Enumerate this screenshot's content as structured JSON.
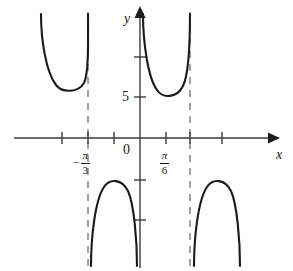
{
  "figure": {
    "background_color": "#ffffff",
    "curve_color": "#1a1a1a",
    "axis_color": "#3b3b3b",
    "asymptote_color": "#8c8c8c"
  },
  "axes": {
    "x_label": "x",
    "y_label": "y",
    "origin_label": "0"
  },
  "x_tick_labels": [
    {
      "id": "neg-pi-over-3",
      "sign": "−",
      "numerator": "π",
      "denominator": "3",
      "x_value": -1.0471975512
    },
    {
      "id": "pi-over-6",
      "sign": "",
      "numerator": "π",
      "denominator": "6",
      "x_value": 0.5235987756
    }
  ],
  "y_tick_labels": [
    {
      "id": "y-five",
      "text": "5",
      "y_value": 5
    }
  ],
  "chart_data": {
    "type": "line",
    "title": "",
    "xlabel": "x",
    "ylabel": "y",
    "grid": false,
    "legend": null,
    "function_form": "y = 5 sec(3x)",
    "xlim": [
      -1.85,
      1.85
    ],
    "ylim": [
      -11.5,
      13.5
    ],
    "x_axis": {
      "tick_pixel_positions": [
        62,
        88,
        114,
        166,
        190,
        222
      ],
      "labeled_ticks": [
        {
          "label": "-π/3",
          "pixel_x": 88
        },
        {
          "label": "π/6",
          "pixel_x": 166
        }
      ],
      "arrow": "right"
    },
    "y_axis": {
      "tick_values": [
        10,
        5,
        -5,
        -10
      ],
      "tick_pixel_positions": [
        57,
        97,
        180,
        220
      ],
      "labeled_ticks": [
        {
          "label": "5",
          "pixel_y": 97
        }
      ],
      "arrow": "up"
    },
    "asymptotes": [
      {
        "label": "x = -π/2",
        "pixel_x": 88,
        "style": "dashed"
      },
      {
        "label": "x = π/2",
        "pixel_x": 190,
        "style": "dashed"
      }
    ],
    "branches": [
      {
        "name": "upper-left-branch",
        "shape": "opens-upward",
        "minimum_point": {
          "pixel": [
            70,
            92
          ],
          "value": 5
        },
        "path": "M 41,14 C 41,40 46,72 56,85 C 62,93 78,93 84,83 C 89,73 88,40 88,14"
      },
      {
        "name": "upper-middle-branch",
        "shape": "opens-upward",
        "minimum_point": {
          "pixel": [
            165,
            97
          ],
          "value": 5
        },
        "path": "M 143,14 C 143,42 148,78 157,90 C 163,99 177,98 183,86 C 189,74 190,38 190,14"
      },
      {
        "name": "lower-left-branch",
        "shape": "opens-downward",
        "maximum_point": {
          "pixel": [
            113,
            180
          ],
          "value": -5
        },
        "path": "M 91,266 C 91,238 95,200 104,187 C 110,178 122,179 128,191 C 134,204 137,240 137,266"
      },
      {
        "name": "lower-right-branch",
        "shape": "opens-downward",
        "maximum_point": {
          "pixel": [
            216,
            180
          ],
          "value": -5
        },
        "path": "M 194,266 C 194,238 198,200 207,187 C 213,178 225,179 231,191 C 237,204 240,240 240,266"
      }
    ]
  }
}
